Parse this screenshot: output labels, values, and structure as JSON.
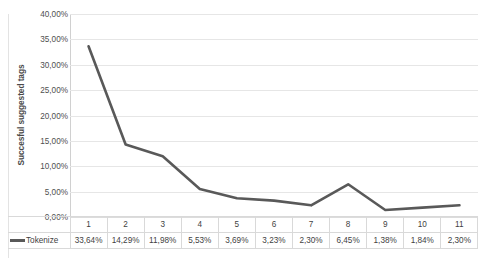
{
  "chart_data": {
    "type": "line",
    "title": "",
    "xlabel": "",
    "ylabel": "Succesful suggested tags",
    "categories": [
      "1",
      "2",
      "3",
      "4",
      "5",
      "6",
      "7",
      "8",
      "9",
      "10",
      "11"
    ],
    "series": [
      {
        "name": "Tokenize",
        "values": [
          33.64,
          14.29,
          11.98,
          5.53,
          3.69,
          3.23,
          2.3,
          6.45,
          1.38,
          1.84,
          2.3
        ],
        "value_labels": [
          "33,64%",
          "14,29%",
          "11,98%",
          "5,53%",
          "3,69%",
          "3,23%",
          "2,30%",
          "6,45%",
          "1,38%",
          "1,84%",
          "2,30%"
        ],
        "color": "#595959"
      }
    ],
    "ylim": [
      0,
      40
    ],
    "ytick_values": [
      0,
      5,
      10,
      15,
      20,
      25,
      30,
      35,
      40
    ],
    "ytick_labels": [
      "0,00%",
      "5,00%",
      "10,00%",
      "15,00%",
      "20,00%",
      "25,00%",
      "30,00%",
      "35,00%",
      "40,00%"
    ],
    "grid": "horizontal",
    "legend_position": "bottom-data-table",
    "data_table_visible": true,
    "markers": false
  },
  "colors": {
    "series_line": "#595959",
    "gridline": "#e6e6e6",
    "axis_line": "#d0d0d0",
    "table_border": "#d9d9d9",
    "text": "#3f3f3f",
    "background": "#ffffff"
  }
}
